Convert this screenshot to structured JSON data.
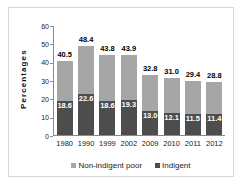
{
  "chart_data": {
    "type": "bar",
    "subtype": "stacked-bar",
    "title": "",
    "xlabel": "",
    "ylabel": "Percentages",
    "ylim": [
      0,
      60
    ],
    "yticks": [
      0,
      10,
      20,
      30,
      40,
      50,
      60
    ],
    "grid": false,
    "legend_position": "bottom-center",
    "categories": [
      "1980",
      "1990",
      "1999",
      "2002",
      "2009",
      "2010",
      "2011",
      "2012"
    ],
    "series": [
      {
        "name": "Indigent",
        "color": "#4d4d4d",
        "values": [
          18.6,
          22.6,
          18.6,
          19.3,
          13.0,
          12.1,
          11.5,
          11.4
        ]
      },
      {
        "name": "Non-indigent poor",
        "color": "#a6a6a6",
        "values": [
          21.9,
          25.8,
          25.2,
          24.6,
          19.8,
          18.9,
          17.9,
          17.4
        ]
      }
    ],
    "totals": [
      40.5,
      48.4,
      43.8,
      43.9,
      32.8,
      31.0,
      29.4,
      28.8
    ],
    "total_labels": [
      "40.5",
      "48.4",
      "43.8",
      "43.9",
      "32.8",
      "31.0",
      "29.4",
      "28.8"
    ],
    "indigent_labels": [
      "18.6",
      "22.6",
      "18.6",
      "19.3",
      "13.0",
      "12.1",
      "11.5",
      "11.4"
    ],
    "ytick_labels": [
      "0",
      "10",
      "20",
      "30",
      "40",
      "50",
      "60"
    ]
  },
  "legend": {
    "entries": [
      {
        "label": "Non-indigent poor",
        "color": "#a6a6a6"
      },
      {
        "label": "Indigent",
        "color": "#4d4d4d"
      }
    ]
  }
}
